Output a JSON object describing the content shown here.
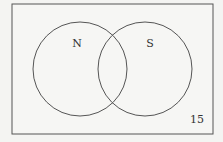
{
  "diagram": {
    "type": "venn",
    "sets": [
      {
        "label": "N"
      },
      {
        "label": "S"
      }
    ],
    "outside_value": "15"
  }
}
